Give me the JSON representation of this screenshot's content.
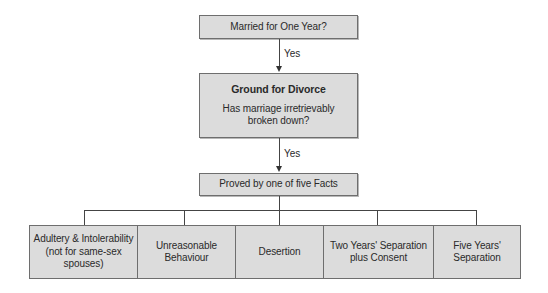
{
  "diagram": {
    "type": "flowchart",
    "nodes": {
      "married": "Married for One Year?",
      "ground": {
        "title": "Ground for Divorce",
        "line1": "Has marriage irretrievably",
        "line2": "broken down?"
      },
      "proved": "Proved by one of five Facts"
    },
    "edges": {
      "edge1_label": "Yes",
      "edge2_label": "Yes"
    },
    "facts": [
      {
        "lines": [
          "Adultery & Intolerability",
          "(not for same-sex",
          "spouses)"
        ]
      },
      {
        "lines": [
          "Unreasonable",
          "Behaviour"
        ]
      },
      {
        "lines": [
          "Desertion"
        ]
      },
      {
        "lines": [
          "Two Years' Separation",
          "plus Consent"
        ]
      },
      {
        "lines": [
          "Five Years'",
          "Separation"
        ]
      }
    ]
  },
  "colors": {
    "box_fill": "#dcdcdc",
    "box_border": "#6e6e6e",
    "line": "#444444",
    "text": "#2a2a2a"
  }
}
